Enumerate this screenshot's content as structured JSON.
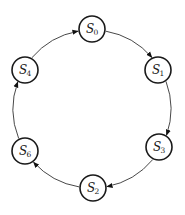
{
  "diagram": {
    "type": "state-cycle",
    "nodes": [
      {
        "id": "S0",
        "label": "S",
        "sub": "0",
        "x": 92,
        "y": 29
      },
      {
        "id": "S1",
        "label": "S",
        "sub": "1",
        "x": 158,
        "y": 70
      },
      {
        "id": "S3",
        "label": "S",
        "sub": "3",
        "x": 159,
        "y": 147
      },
      {
        "id": "S2",
        "label": "S",
        "sub": "2",
        "x": 93,
        "y": 188
      },
      {
        "id": "S6",
        "label": "S",
        "sub": "6",
        "x": 25,
        "y": 151
      },
      {
        "id": "S4",
        "label": "S",
        "sub": "4",
        "x": 25,
        "y": 70
      }
    ],
    "edges": [
      {
        "from": "S0",
        "to": "S1"
      },
      {
        "from": "S1",
        "to": "S3"
      },
      {
        "from": "S3",
        "to": "S2"
      },
      {
        "from": "S2",
        "to": "S6"
      },
      {
        "from": "S6",
        "to": "S4"
      },
      {
        "from": "S4",
        "to": "S0"
      }
    ],
    "node_radius": 13,
    "colors": {
      "stroke": "#1a1a1a",
      "edge": "#333333",
      "background": "#ffffff"
    }
  }
}
